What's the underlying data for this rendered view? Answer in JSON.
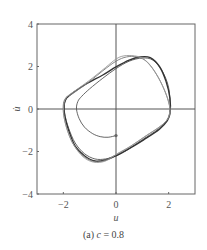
{
  "chart_data": {
    "type": "line",
    "title": "",
    "caption": {
      "prefix": "(a) ",
      "variable": "c",
      "suffix": " = 0.8"
    },
    "xlabel": "u",
    "ylabel": "u̇",
    "xlim": [
      -3,
      3
    ],
    "ylim": [
      -4,
      4
    ],
    "xticks": [
      -2,
      0,
      2
    ],
    "xtick_labels": [
      "−2",
      "0",
      "2"
    ],
    "yticks": [
      -4,
      -2,
      0,
      2,
      4
    ],
    "ytick_labels": [
      "−4",
      "−2",
      "0",
      "2",
      "4"
    ],
    "grid": false,
    "zero_lines": true,
    "legend": "none",
    "series": [
      {
        "name": "transient-from-start",
        "color": "#555555",
        "points": [
          [
            0.0,
            -1.25
          ],
          [
            -0.3,
            -1.33
          ],
          [
            -0.6,
            -1.3
          ],
          [
            -0.9,
            -1.15
          ],
          [
            -1.2,
            -0.85
          ],
          [
            -1.4,
            -0.45
          ],
          [
            -1.5,
            0.0
          ],
          [
            -1.45,
            0.35
          ],
          [
            -1.3,
            0.6
          ],
          [
            -1.0,
            0.95
          ],
          [
            -0.5,
            1.45
          ],
          [
            0.0,
            1.9
          ],
          [
            0.5,
            2.25
          ],
          [
            1.0,
            2.4
          ],
          [
            1.4,
            2.3
          ],
          [
            1.75,
            1.8
          ],
          [
            2.0,
            1.0
          ],
          [
            2.05,
            0.0
          ],
          [
            1.95,
            -0.5
          ],
          [
            1.6,
            -0.95
          ],
          [
            1.0,
            -1.45
          ],
          [
            0.4,
            -1.95
          ],
          [
            0.0,
            -2.2
          ],
          [
            -0.4,
            -2.35
          ],
          [
            -0.8,
            -2.35
          ],
          [
            -1.2,
            -2.1
          ],
          [
            -1.55,
            -1.6
          ],
          [
            -1.8,
            -0.9
          ],
          [
            -1.95,
            -0.2
          ],
          [
            -1.95,
            0.3
          ],
          [
            -1.85,
            0.55
          ]
        ]
      },
      {
        "name": "limit-cycle-1",
        "color": "#333333",
        "points": [
          [
            -1.85,
            0.55
          ],
          [
            -1.6,
            0.8
          ],
          [
            -1.1,
            1.2
          ],
          [
            -0.5,
            1.6
          ],
          [
            0.0,
            1.98
          ],
          [
            0.5,
            2.3
          ],
          [
            0.9,
            2.45
          ],
          [
            1.3,
            2.42
          ],
          [
            1.65,
            2.0
          ],
          [
            1.9,
            1.3
          ],
          [
            2.05,
            0.5
          ],
          [
            2.05,
            -0.2
          ],
          [
            1.95,
            -0.55
          ],
          [
            1.65,
            -0.95
          ],
          [
            1.05,
            -1.45
          ],
          [
            0.45,
            -1.9
          ],
          [
            0.0,
            -2.2
          ],
          [
            -0.4,
            -2.4
          ],
          [
            -0.8,
            -2.45
          ],
          [
            -1.2,
            -2.2
          ],
          [
            -1.55,
            -1.75
          ],
          [
            -1.8,
            -1.0
          ],
          [
            -1.95,
            -0.3
          ],
          [
            -1.97,
            0.2
          ],
          [
            -1.9,
            0.48
          ],
          [
            -1.8,
            0.6
          ]
        ]
      },
      {
        "name": "limit-cycle-2",
        "color": "#777777",
        "points": [
          [
            -1.8,
            0.6
          ],
          [
            -1.5,
            0.85
          ],
          [
            -1.0,
            1.3
          ],
          [
            -0.5,
            1.8
          ],
          [
            0.0,
            2.25
          ],
          [
            0.4,
            2.45
          ],
          [
            0.8,
            2.45
          ],
          [
            1.2,
            2.2
          ],
          [
            1.6,
            1.5
          ],
          [
            1.9,
            0.7
          ],
          [
            2.05,
            0.0
          ],
          [
            2.0,
            -0.4
          ],
          [
            1.7,
            -0.8
          ],
          [
            1.1,
            -1.3
          ],
          [
            0.5,
            -1.8
          ],
          [
            0.0,
            -2.15
          ],
          [
            -0.5,
            -2.45
          ],
          [
            -0.9,
            -2.45
          ],
          [
            -1.3,
            -2.15
          ],
          [
            -1.65,
            -1.6
          ],
          [
            -1.88,
            -0.85
          ],
          [
            -2.0,
            -0.15
          ],
          [
            -1.98,
            0.35
          ],
          [
            -1.85,
            0.6
          ]
        ]
      },
      {
        "name": "limit-cycle-3",
        "color": "#999999",
        "points": [
          [
            -1.85,
            0.6
          ],
          [
            -1.45,
            0.95
          ],
          [
            -0.9,
            1.45
          ],
          [
            -0.4,
            1.95
          ],
          [
            0.0,
            2.35
          ],
          [
            0.3,
            2.5
          ],
          [
            0.7,
            2.5
          ],
          [
            1.05,
            2.35
          ],
          [
            1.45,
            1.8
          ],
          [
            1.8,
            1.0
          ],
          [
            2.03,
            0.2
          ],
          [
            2.0,
            -0.35
          ],
          [
            1.75,
            -0.75
          ],
          [
            1.15,
            -1.25
          ],
          [
            0.55,
            -1.75
          ],
          [
            0.05,
            -2.1
          ],
          [
            -0.4,
            -2.45
          ],
          [
            -0.85,
            -2.5
          ],
          [
            -1.25,
            -2.25
          ],
          [
            -1.6,
            -1.7
          ],
          [
            -1.85,
            -1.0
          ],
          [
            -1.98,
            -0.3
          ],
          [
            -1.97,
            0.3
          ],
          [
            -1.85,
            0.6
          ]
        ]
      }
    ],
    "start_marker": {
      "u": 0.0,
      "udot": -1.25,
      "color": "#666666"
    }
  }
}
